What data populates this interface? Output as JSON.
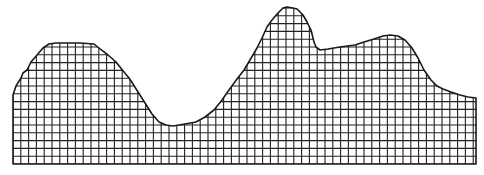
{
  "figure": {
    "width": 484,
    "height": 175,
    "background": "#ffffff",
    "stroke_color": "#1a1a1a",
    "grid_color": "#222222",
    "grid_spacing": 7.8,
    "baseline_y": 164,
    "left_x": 13,
    "right_x": 476,
    "outline": [
      [
        13,
        164
      ],
      [
        13,
        95
      ],
      [
        16,
        86
      ],
      [
        21,
        78
      ],
      [
        23,
        73
      ],
      [
        27,
        70
      ],
      [
        31,
        62
      ],
      [
        37,
        55
      ],
      [
        43,
        48
      ],
      [
        49,
        44
      ],
      [
        56,
        43
      ],
      [
        80,
        43
      ],
      [
        94,
        44
      ],
      [
        99,
        48
      ],
      [
        108,
        55
      ],
      [
        116,
        62
      ],
      [
        124,
        72
      ],
      [
        129,
        78
      ],
      [
        133,
        84
      ],
      [
        138,
        92
      ],
      [
        145,
        103
      ],
      [
        152,
        114
      ],
      [
        159,
        122
      ],
      [
        166,
        125
      ],
      [
        173,
        126
      ],
      [
        185,
        124
      ],
      [
        196,
        122
      ],
      [
        205,
        117
      ],
      [
        214,
        110
      ],
      [
        222,
        100
      ],
      [
        229,
        90
      ],
      [
        237,
        79
      ],
      [
        244,
        70
      ],
      [
        250,
        60
      ],
      [
        257,
        48
      ],
      [
        262,
        38
      ],
      [
        267,
        27
      ],
      [
        272,
        20
      ],
      [
        278,
        13
      ],
      [
        283,
        8
      ],
      [
        287,
        7
      ],
      [
        293,
        8
      ],
      [
        297,
        9
      ],
      [
        303,
        15
      ],
      [
        307,
        22
      ],
      [
        311,
        30
      ],
      [
        314,
        42
      ],
      [
        316,
        47
      ],
      [
        320,
        50
      ],
      [
        328,
        49
      ],
      [
        340,
        47
      ],
      [
        355,
        45
      ],
      [
        364,
        42
      ],
      [
        374,
        39
      ],
      [
        383,
        36
      ],
      [
        390,
        35
      ],
      [
        398,
        36
      ],
      [
        405,
        40
      ],
      [
        412,
        48
      ],
      [
        418,
        58
      ],
      [
        424,
        70
      ],
      [
        431,
        80
      ],
      [
        437,
        86
      ],
      [
        443,
        89
      ],
      [
        451,
        92
      ],
      [
        460,
        95
      ],
      [
        468,
        97
      ],
      [
        476,
        98
      ],
      [
        476,
        164
      ]
    ]
  }
}
